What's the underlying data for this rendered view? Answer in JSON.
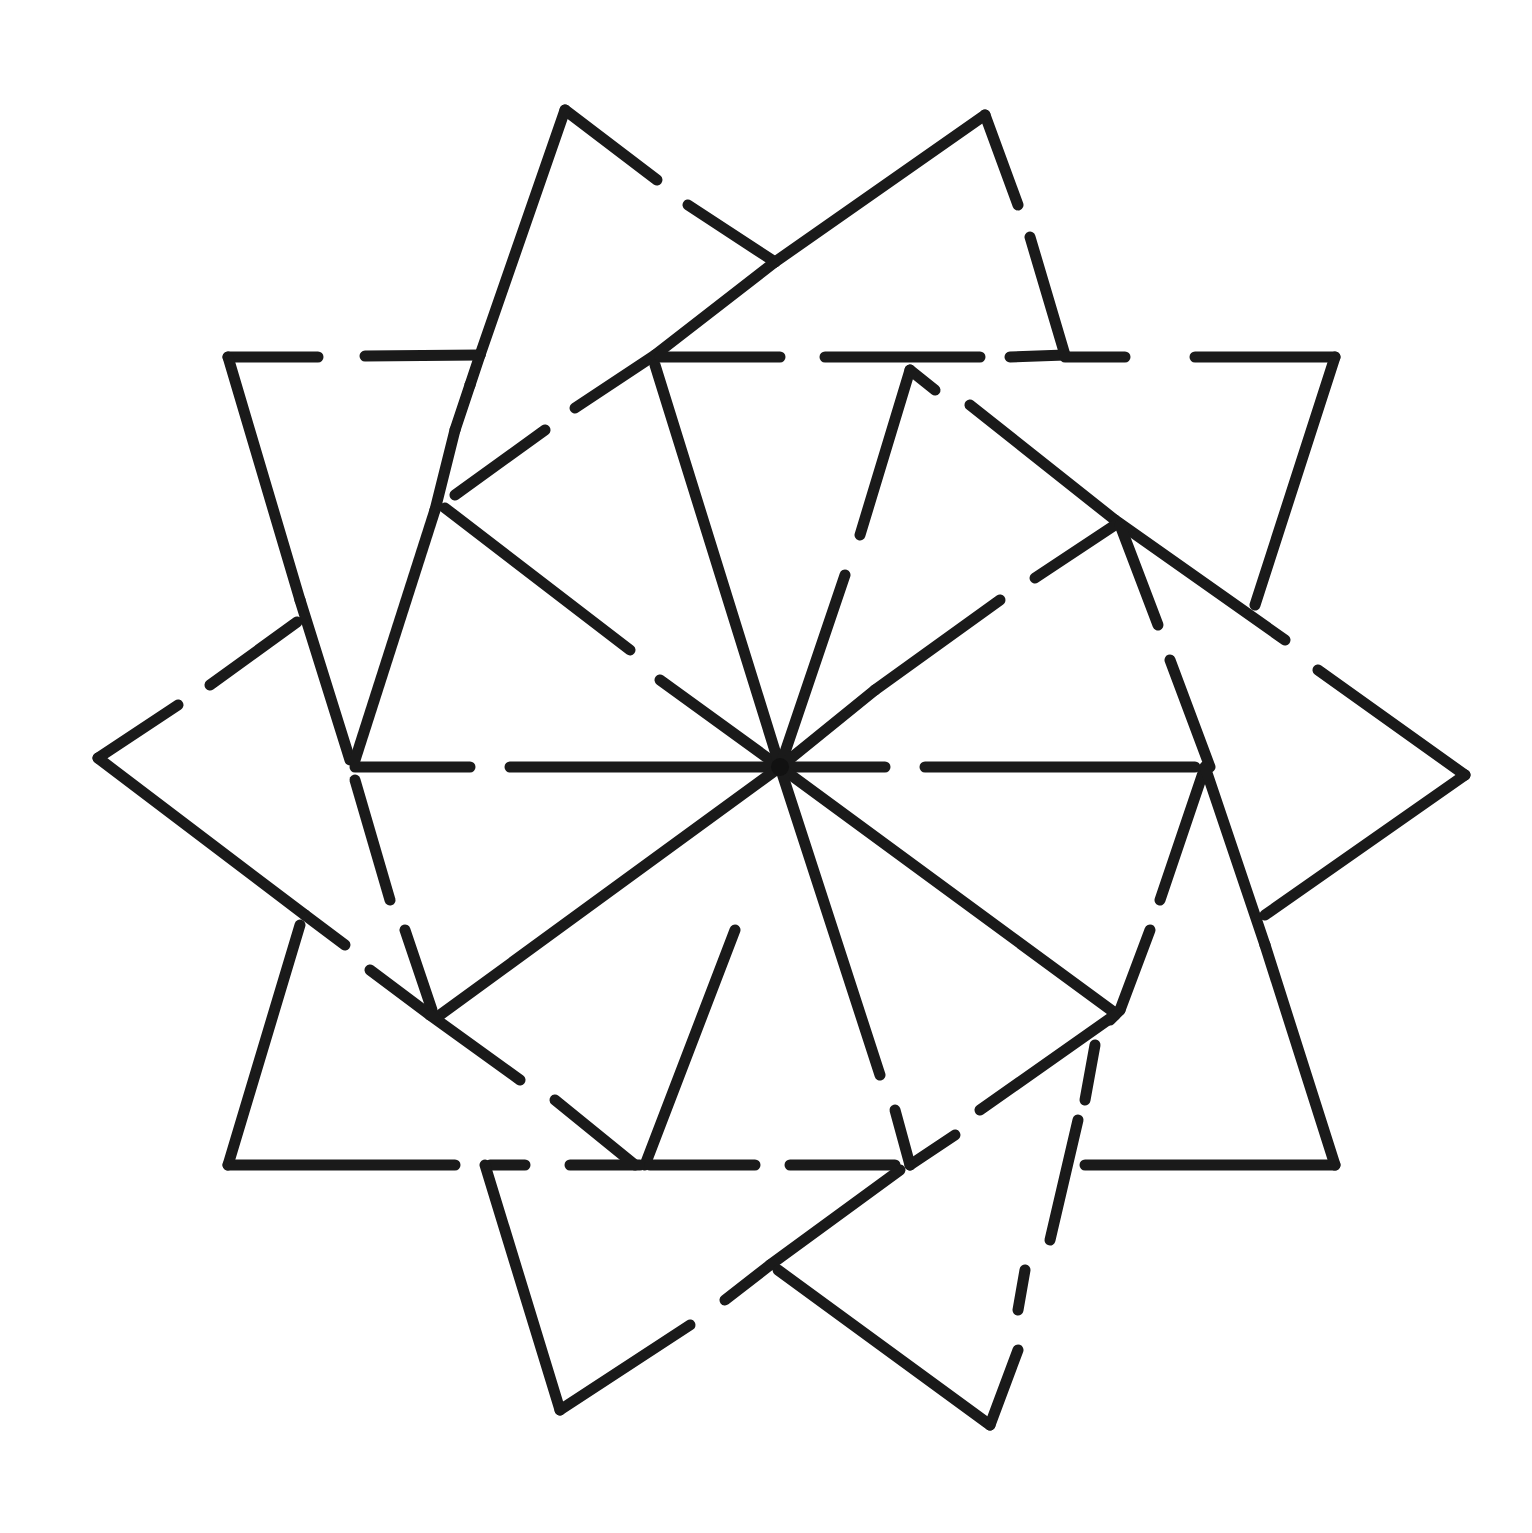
{
  "diagram": {
    "type": "geometric-star",
    "stroke_color": "#1a1a1a",
    "background_color": "#ffffff",
    "center": [
      780,
      767
    ],
    "segments": [
      [
        565,
        110,
        657,
        180
      ],
      [
        688,
        205,
        775,
        262
      ],
      [
        565,
        110,
        480,
        355
      ],
      [
        480,
        355,
        470,
        385
      ],
      [
        985,
        115,
        1018,
        205
      ],
      [
        1030,
        237,
        1065,
        355
      ],
      [
        985,
        115,
        775,
        262
      ],
      [
        775,
        262,
        655,
        355
      ],
      [
        655,
        355,
        575,
        408
      ],
      [
        545,
        430,
        455,
        495
      ],
      [
        228,
        357,
        318,
        357
      ],
      [
        365,
        356,
        480,
        355
      ],
      [
        228,
        357,
        300,
        600
      ],
      [
        300,
        600,
        350,
        760
      ],
      [
        660,
        357,
        780,
        357
      ],
      [
        825,
        357,
        980,
        357
      ],
      [
        1010,
        357,
        1065,
        355
      ],
      [
        1065,
        357,
        1125,
        357
      ],
      [
        1195,
        357,
        1335,
        357
      ],
      [
        1335,
        357,
        1255,
        605
      ],
      [
        470,
        385,
        455,
        430
      ],
      [
        455,
        430,
        435,
        510
      ],
      [
        435,
        510,
        355,
        760
      ],
      [
        445,
        508,
        630,
        650
      ],
      [
        660,
        680,
        780,
        767
      ],
      [
        655,
        365,
        780,
        767
      ],
      [
        910,
        370,
        860,
        535
      ],
      [
        845,
        575,
        780,
        767
      ],
      [
        910,
        370,
        935,
        390
      ],
      [
        970,
        405,
        1115,
        520
      ],
      [
        1115,
        520,
        1285,
        640
      ],
      [
        1318,
        670,
        1465,
        775
      ],
      [
        1115,
        525,
        1035,
        578
      ],
      [
        1000,
        600,
        875,
        690
      ],
      [
        875,
        690,
        780,
        767
      ],
      [
        1120,
        525,
        1158,
        625
      ],
      [
        1170,
        660,
        1210,
        767
      ],
      [
        1465,
        775,
        1265,
        915
      ],
      [
        98,
        758,
        178,
        705
      ],
      [
        210,
        685,
        297,
        622
      ],
      [
        98,
        758,
        305,
        915
      ],
      [
        305,
        915,
        345,
        945
      ],
      [
        355,
        767,
        470,
        767
      ],
      [
        510,
        767,
        780,
        767
      ],
      [
        780,
        767,
        885,
        767
      ],
      [
        925,
        767,
        1195,
        767
      ],
      [
        355,
        780,
        390,
        900
      ],
      [
        405,
        930,
        432,
        1010
      ],
      [
        440,
        1015,
        780,
        767
      ],
      [
        780,
        767,
        1115,
        1013
      ],
      [
        1205,
        767,
        1160,
        900
      ],
      [
        1150,
        930,
        1120,
        1010
      ],
      [
        1120,
        1010,
        1110,
        1020
      ],
      [
        1205,
        767,
        1265,
        945
      ],
      [
        1265,
        945,
        1335,
        1165
      ],
      [
        370,
        970,
        430,
        1015
      ],
      [
        430,
        1015,
        520,
        1080
      ],
      [
        555,
        1100,
        635,
        1165
      ],
      [
        735,
        930,
        645,
        1165
      ],
      [
        780,
        767,
        880,
        1075
      ],
      [
        895,
        1110,
        910,
        1165
      ],
      [
        1115,
        1015,
        980,
        1110
      ],
      [
        955,
        1135,
        910,
        1165
      ],
      [
        228,
        1165,
        300,
        925
      ],
      [
        228,
        1165,
        455,
        1165
      ],
      [
        490,
        1165,
        525,
        1165
      ],
      [
        570,
        1165,
        640,
        1165
      ],
      [
        650,
        1165,
        755,
        1165
      ],
      [
        790,
        1165,
        895,
        1165
      ],
      [
        1085,
        1165,
        1335,
        1165
      ],
      [
        485,
        1165,
        560,
        1410
      ],
      [
        560,
        1410,
        690,
        1325
      ],
      [
        725,
        1300,
        770,
        1265
      ],
      [
        770,
        1265,
        900,
        1170
      ],
      [
        1095,
        1045,
        1085,
        1100
      ],
      [
        1078,
        1120,
        1050,
        1240
      ],
      [
        1025,
        1270,
        1018,
        1310
      ],
      [
        778,
        1270,
        990,
        1425
      ],
      [
        990,
        1425,
        1018,
        1350
      ]
    ]
  }
}
